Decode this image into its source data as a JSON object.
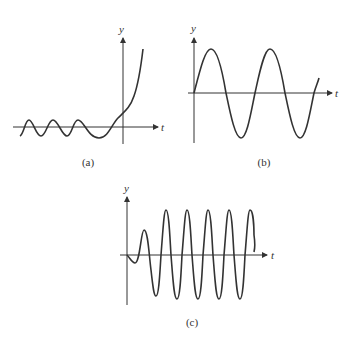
{
  "panels": {
    "a": {
      "caption": "(a)",
      "ylabel": "y",
      "xlabel": "t"
    },
    "b": {
      "caption": "(b)",
      "ylabel": "y",
      "xlabel": "t"
    },
    "c": {
      "caption": "(c)",
      "ylabel": "y",
      "xlabel": "t"
    }
  },
  "colors": {
    "stroke": "#333333",
    "background": "#ffffff"
  }
}
